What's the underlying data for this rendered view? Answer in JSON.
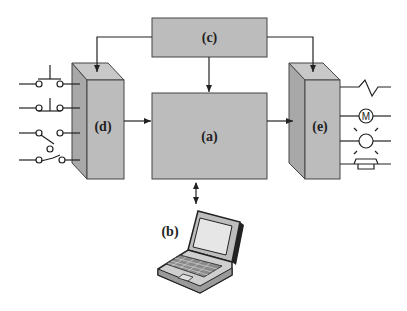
{
  "diagram": {
    "title": "",
    "blocks": {
      "a": {
        "label": "(a)"
      },
      "b": {
        "label": "(b)"
      },
      "c": {
        "label": "(c)"
      },
      "d": {
        "label": "(d)"
      },
      "e": {
        "label": "(e)"
      }
    },
    "inputs": [
      {
        "icon": "pushbutton-normally-open-icon"
      },
      {
        "icon": "pushbutton-normally-closed-icon"
      },
      {
        "icon": "switch-normally-open-icon"
      },
      {
        "icon": "switch-normally-closed-icon"
      }
    ],
    "outputs": [
      {
        "icon": "resistor-load-icon"
      },
      {
        "icon": "motor-icon",
        "text": "M"
      },
      {
        "icon": "lamp-icon"
      },
      {
        "icon": "horn-icon"
      }
    ],
    "colors": {
      "block_fill": "#bcbcbc",
      "block_side": "#a8a8a8",
      "stroke": "#222222"
    }
  }
}
